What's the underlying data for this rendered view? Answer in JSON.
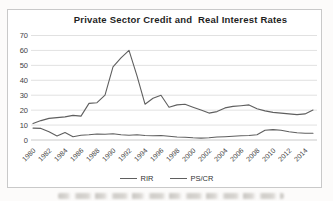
{
  "chart": {
    "title": "Private Sector Credit and  Real Interest Rates",
    "legend": {
      "rir_label": "RIR",
      "pscr_label": "PS/CR"
    }
  },
  "chart_data": {
    "type": "line",
    "title": "Private Sector Credit and  Real Interest Rates",
    "x": [
      1980,
      1981,
      1982,
      1983,
      1984,
      1985,
      1986,
      1987,
      1988,
      1989,
      1990,
      1991,
      1992,
      1993,
      1994,
      1995,
      1996,
      1997,
      1998,
      1999,
      2000,
      2001,
      2002,
      2003,
      2004,
      2005,
      2006,
      2007,
      2008,
      2009,
      2010,
      2011,
      2012,
      2013,
      2014,
      2015
    ],
    "x_tick_labels": [
      "1980",
      "1982",
      "1984",
      "1986",
      "1988",
      "1990",
      "1992",
      "1994",
      "1996",
      "1998",
      "2000",
      "2002",
      "2004",
      "2006",
      "2008",
      "2010",
      "2012",
      "2014"
    ],
    "series": [
      {
        "name": "RIR",
        "values": [
          8,
          7.8,
          5.5,
          2.7,
          5,
          2.2,
          3.2,
          3.5,
          4,
          3.8,
          4.2,
          3.5,
          3.2,
          3.5,
          3,
          2.8,
          3,
          2.5,
          2,
          1.8,
          1.5,
          1.3,
          1.5,
          2,
          2.2,
          2.5,
          2.8,
          3,
          3.5,
          6.5,
          7,
          6.5,
          5.5,
          4.8,
          4.5,
          4.5
        ]
      },
      {
        "name": "PS/CR",
        "values": [
          11,
          13,
          14.5,
          15,
          15.5,
          16.5,
          16,
          24.5,
          25,
          30,
          49,
          55,
          60,
          43,
          24,
          28,
          30,
          22,
          23.5,
          24,
          22,
          20,
          18,
          19,
          21.5,
          22.5,
          23,
          23.5,
          21,
          19.5,
          18.5,
          18,
          17.5,
          17,
          17.5,
          20
        ]
      }
    ],
    "ylim": [
      0,
      70
    ],
    "yticks": [
      0,
      10,
      20,
      30,
      40,
      50,
      60,
      70
    ],
    "grid": true,
    "legend_position": "bottom",
    "xlabel": "",
    "ylabel": "",
    "line_color": "#5f5f5f",
    "gridline_color": "#d9d9d9",
    "zero_line_color": "#bdbdbd",
    "tick_label_color": "#3f3f3f"
  }
}
